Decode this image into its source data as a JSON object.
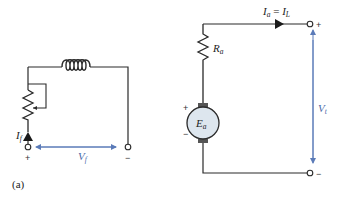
{
  "figure": {
    "caption": "(a)",
    "colors": {
      "wire": "#2a2a2a",
      "voltage_arrow": "#5b7bb8",
      "machine_fill": "#dde6ee"
    },
    "field_circuit": {
      "current_label": {
        "main": "I",
        "sub": "f"
      },
      "voltage_label": {
        "main": "V",
        "sub": "f"
      },
      "plus_terminal": "+",
      "minus_terminal": "−",
      "components": [
        "field-winding-inductor",
        "rheostat"
      ]
    },
    "armature_circuit": {
      "current_label": {
        "main": "I",
        "sub": "a",
        "eq": " = ",
        "main2": "I",
        "sub2": "L"
      },
      "resistor_label": {
        "main": "R",
        "sub": "a"
      },
      "emf_label": {
        "main": "E",
        "sub": "a"
      },
      "voltage_label": {
        "main": "V",
        "sub": "t"
      },
      "machine_plus": "+",
      "machine_minus": "−",
      "plus_terminal": "+",
      "minus_terminal": "−"
    }
  }
}
